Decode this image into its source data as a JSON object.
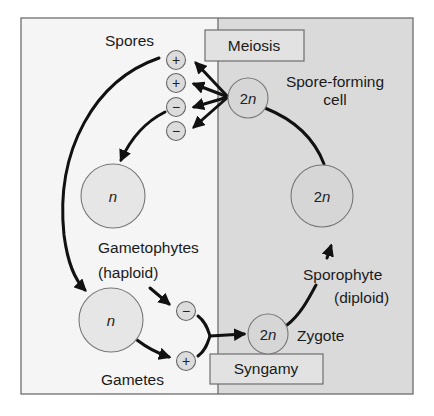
{
  "diagram": {
    "colors": {
      "haploid_panel": "#f5f5f5",
      "diploid_panel": "#dadada",
      "cell_fill": "#dcdcdc",
      "cell_stroke": "#7a7a7a",
      "box_fill": "#e2e2e2",
      "arrow": "#111111"
    },
    "labels": {
      "spores": "Spores",
      "meiosis": "Meiosis",
      "spore_forming_line1": "Spore-forming",
      "spore_forming_line2": "cell",
      "gametophytes_line1": "Gametophytes",
      "gametophytes_line2": "(haploid)",
      "gametes": "Gametes",
      "syngamy": "Syngamy",
      "zygote": "Zygote",
      "sporophyte_line1": "Sporophyte",
      "sporophyte_line2": "(diploid)"
    },
    "cells": {
      "spore_forming_cell": {
        "num": "2",
        "var": "n"
      },
      "sporophyte": {
        "num": "2",
        "var": "n"
      },
      "zygote": {
        "num": "2",
        "var": "n"
      },
      "gametophyte_upper": {
        "num": "",
        "var": "n"
      },
      "gametophyte_lower": {
        "num": "",
        "var": "n"
      }
    },
    "spores": [
      "+",
      "+",
      "−",
      "−"
    ],
    "gametes": [
      "−",
      "+"
    ]
  }
}
